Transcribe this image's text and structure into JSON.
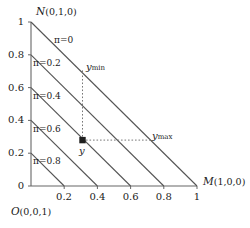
{
  "figure": {
    "type": "ternary-simplex-diagram",
    "axes": {
      "x": {
        "label_symbol": "M",
        "label_coord": "(1,0,0)",
        "ticks": [
          "0.2",
          "0.4",
          "0.6",
          "0.8",
          "1"
        ],
        "tick_values": [
          0.2,
          0.4,
          0.6,
          0.8,
          1.0
        ],
        "min": 0,
        "max": 1
      },
      "y": {
        "label_symbol": "N",
        "label_coord": "(0,1,0)",
        "ticks": [
          "1",
          "0.8",
          "0.6",
          "0.4",
          "0.2",
          "0"
        ],
        "tick_values": [
          1.0,
          0.8,
          0.6,
          0.4,
          0.2,
          0.0
        ],
        "min": 0,
        "max": 1
      },
      "origin": {
        "label_symbol": "O",
        "label_coord": "(0,0,1)",
        "tick": "0"
      }
    },
    "iso_lines": [
      {
        "label": "π=0",
        "value": 0.0,
        "intercept": 1.0
      },
      {
        "label": "π=0.2",
        "value": 0.2,
        "intercept": 0.8
      },
      {
        "label": "π=0.4",
        "value": 0.4,
        "intercept": 0.6
      },
      {
        "label": "π=0.6",
        "value": 0.6,
        "intercept": 0.4
      },
      {
        "label": "π=0.8",
        "value": 0.8,
        "intercept": 0.2
      }
    ],
    "point": {
      "label": "y",
      "x": 0.31,
      "y": 0.28,
      "marker": "filled-square"
    },
    "projections": [
      {
        "label_base": "y",
        "label_sub": "min",
        "direction": "vertical",
        "from_x": 0.31,
        "from_y": 0.28,
        "to_x": 0.31,
        "to_y": 0.69
      },
      {
        "label_base": "y",
        "label_sub": "max",
        "direction": "horizontal",
        "from_x": 0.31,
        "from_y": 0.28,
        "to_x": 0.72,
        "to_y": 0.28
      }
    ],
    "colors": {
      "line": "#555555",
      "axis": "#666666",
      "text": "#1a1a1a",
      "background": "#ffffff",
      "dotted": "#777777"
    }
  }
}
